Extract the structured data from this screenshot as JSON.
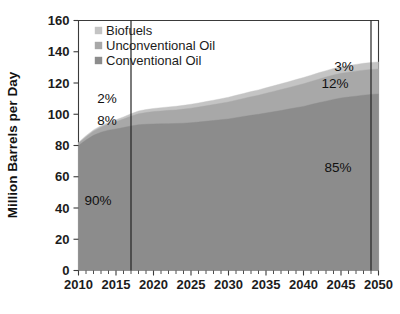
{
  "chart_data": {
    "type": "area",
    "stacked": true,
    "title": "",
    "xlabel": "",
    "ylabel": "Million Barrels per Day",
    "xlim": [
      2010,
      2050
    ],
    "ylim": [
      0,
      160
    ],
    "ytick_values": [
      0,
      20,
      40,
      60,
      80,
      100,
      120,
      140,
      160
    ],
    "ytick_labels": [
      "0",
      "20",
      "40",
      "60",
      "80",
      "100",
      "120",
      "140",
      "160"
    ],
    "xtick_values": [
      2010,
      2015,
      2020,
      2025,
      2030,
      2035,
      2040,
      2045,
      2050
    ],
    "xtick_labels": [
      "2010",
      "2015",
      "2020",
      "2025",
      "2030",
      "2035",
      "2040",
      "2045",
      "2050"
    ],
    "minor_xtick_step": 1,
    "grid": false,
    "legend_position": "top-left-inside",
    "x": [
      2010,
      2011,
      2012,
      2013,
      2014,
      2015,
      2016,
      2017,
      2018,
      2019,
      2020,
      2021,
      2022,
      2023,
      2024,
      2025,
      2026,
      2027,
      2028,
      2029,
      2030,
      2031,
      2032,
      2033,
      2034,
      2035,
      2036,
      2037,
      2038,
      2039,
      2040,
      2041,
      2042,
      2043,
      2044,
      2045,
      2046,
      2047,
      2048,
      2049,
      2050
    ],
    "series": [
      {
        "name": "Conventional Oil",
        "color": "#8c8c8c",
        "values": [
          80.0,
          83.5,
          86.5,
          88.5,
          89.8,
          90.6,
          91.5,
          92.5,
          93.3,
          93.6,
          93.8,
          93.9,
          94.0,
          94.1,
          94.3,
          94.6,
          95.0,
          95.5,
          96.0,
          96.5,
          97.0,
          97.8,
          98.6,
          99.3,
          100.0,
          100.8,
          101.6,
          102.4,
          103.3,
          104.2,
          105.0,
          106.2,
          107.3,
          108.4,
          109.5,
          110.4,
          111.0,
          111.6,
          112.2,
          112.7,
          113.0
        ]
      },
      {
        "name": "Unconventional Oil",
        "color": "#a8a8a8",
        "values": [
          1.4,
          2.0,
          2.6,
          3.2,
          3.9,
          4.6,
          5.4,
          6.2,
          7.0,
          7.5,
          7.9,
          8.2,
          8.5,
          8.7,
          9.0,
          9.3,
          9.6,
          9.9,
          10.2,
          10.5,
          10.9,
          11.2,
          11.5,
          11.9,
          12.2,
          12.6,
          13.0,
          13.4,
          13.7,
          14.1,
          14.5,
          14.8,
          15.1,
          15.4,
          15.6,
          15.8,
          15.9,
          16.0,
          16.0,
          16.0,
          16.0
        ]
      },
      {
        "name": "Biofuels",
        "color": "#c4c4c4",
        "values": [
          0.6,
          0.8,
          0.9,
          1.0,
          1.1,
          1.3,
          1.4,
          1.6,
          1.8,
          1.9,
          2.0,
          2.1,
          2.2,
          2.3,
          2.4,
          2.5,
          2.6,
          2.7,
          2.8,
          2.9,
          3.0,
          3.1,
          3.2,
          3.3,
          3.4,
          3.5,
          3.6,
          3.7,
          3.8,
          3.9,
          4.0,
          4.0,
          4.1,
          4.1,
          4.2,
          4.2,
          4.3,
          4.3,
          4.4,
          4.4,
          4.5
        ]
      }
    ],
    "reference_lines": [
      {
        "name": "left-reference-line",
        "x": 2017
      },
      {
        "name": "right-reference-line",
        "x": 2049
      }
    ],
    "annotations": [
      {
        "name": "annotation-biofuels-left",
        "text": "2%",
        "x": 2013.8,
        "y": 107
      },
      {
        "name": "annotation-unconventional-left",
        "text": "8%",
        "x": 2013.8,
        "y": 93
      },
      {
        "name": "annotation-conventional-left",
        "text": "90%",
        "x": 2012.6,
        "y": 42
      },
      {
        "name": "annotation-biofuels-right",
        "text": "3%",
        "x": 2045.4,
        "y": 128
      },
      {
        "name": "annotation-unconventional-right",
        "text": "12%",
        "x": 2044.2,
        "y": 117
      },
      {
        "name": "annotation-conventional-right",
        "text": "85%",
        "x": 2044.6,
        "y": 63
      }
    ]
  },
  "legend": {
    "items": [
      {
        "label": "Biofuels",
        "color": "#c4c4c4"
      },
      {
        "label": "Unconventional Oil",
        "color": "#a8a8a8"
      },
      {
        "label": "Conventional Oil",
        "color": "#8c8c8c"
      }
    ]
  },
  "axes": {
    "y_title": "Million Barrels per Day"
  }
}
